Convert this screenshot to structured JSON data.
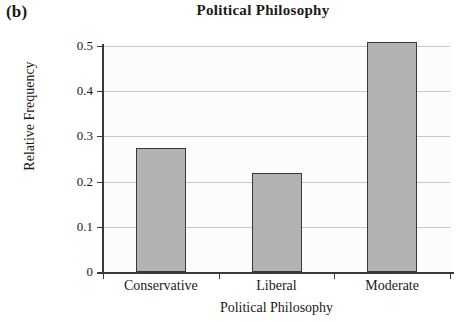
{
  "panel_label": "(b)",
  "chart_data": {
    "type": "bar",
    "title": "Political Philosophy",
    "xlabel": "Political Philosophy",
    "ylabel": "Relative Frequency",
    "categories": [
      "Conservative",
      "Liberal",
      "Moderate"
    ],
    "values": [
      0.275,
      0.218,
      0.508
    ],
    "ylim": [
      0,
      0.5
    ],
    "ytick_labels": [
      "0",
      "0.1",
      "0.2",
      "0.3",
      "0.4",
      "0.5"
    ],
    "ytick_values": [
      0,
      0.1,
      0.2,
      0.3,
      0.4,
      0.5
    ],
    "grid": "horizontal",
    "legend": "none",
    "bar_fill_color": "#b2b2b2",
    "bar_edge_color": "#383838",
    "axis_color": "#3a3a3a",
    "gridline_color": "#c8c8c8",
    "plot_background_color": "#fcfcfc"
  }
}
